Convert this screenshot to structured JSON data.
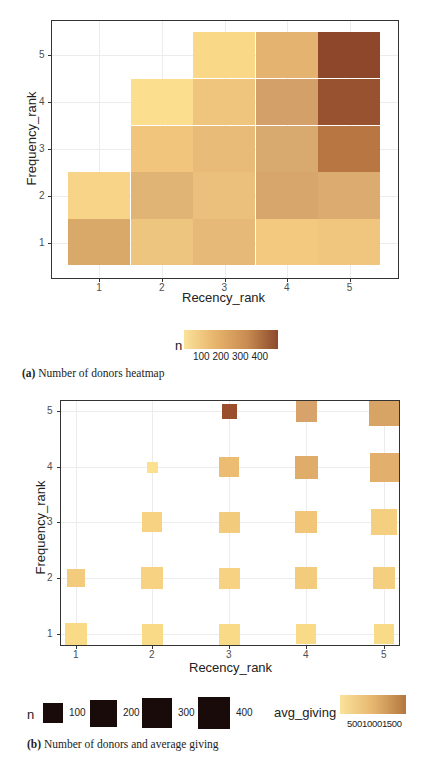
{
  "chart_data": [
    {
      "id": "a",
      "type": "heatmap",
      "caption_label": "(a)",
      "caption_text": "Number of donors heatmap",
      "xlabel": "Recency_rank",
      "ylabel": "Frequency_rank",
      "x_ticks": [
        "1",
        "2",
        "3",
        "4",
        "5"
      ],
      "y_ticks": [
        "1",
        "2",
        "3",
        "4",
        "5"
      ],
      "legend": {
        "title": "n",
        "type": "colorbar",
        "ticks": [
          "100",
          "200",
          "300",
          "400"
        ],
        "color_low": "#fbe29a",
        "color_high": "#8c4a2c"
      },
      "cells": [
        {
          "x": 1,
          "y": 1,
          "n": 210,
          "color": "#d9a96a"
        },
        {
          "x": 1,
          "y": 2,
          "n": 80,
          "color": "#f7d488"
        },
        {
          "x": 2,
          "y": 1,
          "n": 130,
          "color": "#eec57f"
        },
        {
          "x": 2,
          "y": 2,
          "n": 170,
          "color": "#e0b474"
        },
        {
          "x": 2,
          "y": 3,
          "n": 110,
          "color": "#f1c57c"
        },
        {
          "x": 2,
          "y": 4,
          "n": 40,
          "color": "#fbde8e"
        },
        {
          "x": 3,
          "y": 1,
          "n": 160,
          "color": "#e6b978"
        },
        {
          "x": 3,
          "y": 2,
          "n": 150,
          "color": "#eac07c"
        },
        {
          "x": 3,
          "y": 3,
          "n": 150,
          "color": "#e8bc78"
        },
        {
          "x": 3,
          "y": 4,
          "n": 110,
          "color": "#efc47c"
        },
        {
          "x": 3,
          "y": 5,
          "n": 60,
          "color": "#f9d887"
        },
        {
          "x": 4,
          "y": 1,
          "n": 100,
          "color": "#f3c87f"
        },
        {
          "x": 4,
          "y": 2,
          "n": 220,
          "color": "#d6a66d"
        },
        {
          "x": 4,
          "y": 3,
          "n": 200,
          "color": "#d9aa6f"
        },
        {
          "x": 4,
          "y": 4,
          "n": 230,
          "color": "#d2a068"
        },
        {
          "x": 4,
          "y": 5,
          "n": 170,
          "color": "#e3b36f"
        },
        {
          "x": 5,
          "y": 1,
          "n": 120,
          "color": "#f0c67f"
        },
        {
          "x": 5,
          "y": 2,
          "n": 200,
          "color": "#dbab6f"
        },
        {
          "x": 5,
          "y": 3,
          "n": 330,
          "color": "#b77642"
        },
        {
          "x": 5,
          "y": 4,
          "n": 430,
          "color": "#98522f"
        },
        {
          "x": 5,
          "y": 5,
          "n": 460,
          "color": "#8e472b"
        }
      ]
    },
    {
      "id": "b",
      "type": "scatter",
      "subtype": "sized-square-heatmap",
      "caption_label": "(b)",
      "caption_text": "Number of donors and average giving",
      "xlabel": "Recency_rank",
      "ylabel": "Frequency_rank",
      "x_ticks": [
        "1",
        "2",
        "3",
        "4",
        "5"
      ],
      "y_ticks": [
        "1",
        "2",
        "3",
        "4",
        "5"
      ],
      "legend_size": {
        "title": "n",
        "entries": [
          {
            "label": "100",
            "size": 20
          },
          {
            "label": "200",
            "size": 27
          },
          {
            "label": "300",
            "size": 30
          },
          {
            "label": "400",
            "size": 32
          }
        ],
        "key_color": "#1a0b0b"
      },
      "legend_color": {
        "title": "avg_giving",
        "ticks_text": "50010001500",
        "ticks": [
          "500",
          "1000",
          "1500"
        ],
        "color_low": "#fbe29a",
        "color_high": "#b3773f"
      },
      "points": [
        {
          "x": 1,
          "y": 1,
          "n": 250,
          "avg_giving": 300,
          "size": 22,
          "color": "#f9da86"
        },
        {
          "x": 1,
          "y": 2,
          "n": 110,
          "avg_giving": 500,
          "size": 18,
          "color": "#f3cb7c"
        },
        {
          "x": 2,
          "y": 1,
          "n": 210,
          "avg_giving": 300,
          "size": 21,
          "color": "#f9da86"
        },
        {
          "x": 2,
          "y": 2,
          "n": 220,
          "avg_giving": 400,
          "size": 22,
          "color": "#f6d282"
        },
        {
          "x": 2,
          "y": 3,
          "n": 190,
          "avg_giving": 400,
          "size": 20,
          "color": "#f6d282"
        },
        {
          "x": 2,
          "y": 4,
          "n": 40,
          "avg_giving": 300,
          "size": 11,
          "color": "#fbe08f"
        },
        {
          "x": 3,
          "y": 1,
          "n": 240,
          "avg_giving": 300,
          "size": 21,
          "color": "#f9da86"
        },
        {
          "x": 3,
          "y": 2,
          "n": 230,
          "avg_giving": 400,
          "size": 21,
          "color": "#f6d282"
        },
        {
          "x": 3,
          "y": 3,
          "n": 230,
          "avg_giving": 500,
          "size": 21,
          "color": "#f3cb7c"
        },
        {
          "x": 3,
          "y": 4,
          "n": 200,
          "avg_giving": 700,
          "size": 20,
          "color": "#ecbc72"
        },
        {
          "x": 3,
          "y": 5,
          "n": 60,
          "avg_giving": 2000,
          "size": 15,
          "color": "#9a4e2b"
        },
        {
          "x": 4,
          "y": 1,
          "n": 180,
          "avg_giving": 300,
          "size": 20,
          "color": "#f9da86"
        },
        {
          "x": 4,
          "y": 2,
          "n": 260,
          "avg_giving": 500,
          "size": 22,
          "color": "#f3cb7c"
        },
        {
          "x": 4,
          "y": 3,
          "n": 250,
          "avg_giving": 550,
          "size": 22,
          "color": "#f1c678"
        },
        {
          "x": 4,
          "y": 4,
          "n": 280,
          "avg_giving": 900,
          "size": 23,
          "color": "#e0ac69"
        },
        {
          "x": 4,
          "y": 5,
          "n": 220,
          "avg_giving": 1100,
          "size": 21,
          "color": "#d7a36b"
        },
        {
          "x": 5,
          "y": 1,
          "n": 180,
          "avg_giving": 300,
          "size": 20,
          "color": "#f9da86"
        },
        {
          "x": 5,
          "y": 2,
          "n": 260,
          "avg_giving": 450,
          "size": 22,
          "color": "#f5cf80"
        },
        {
          "x": 5,
          "y": 3,
          "n": 320,
          "avg_giving": 450,
          "size": 26,
          "color": "#f5cf80"
        },
        {
          "x": 5,
          "y": 4,
          "n": 400,
          "avg_giving": 850,
          "size": 29,
          "color": "#e2af6c"
        },
        {
          "x": 5,
          "y": 5,
          "n": 430,
          "avg_giving": 1000,
          "size": 30,
          "color": "#d8a466"
        }
      ]
    }
  ]
}
